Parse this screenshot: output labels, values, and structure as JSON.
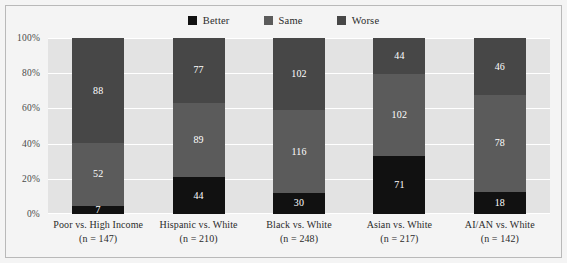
{
  "chart_data": {
    "type": "bar",
    "subtype": "stacked-100-percent",
    "title": "",
    "xlabel": "",
    "ylabel": "",
    "ylim": [
      0,
      100
    ],
    "yticks": [
      "0%",
      "20%",
      "40%",
      "60%",
      "80%",
      "100%"
    ],
    "grid": true,
    "legend_position": "top-center",
    "categories": [
      "Poor vs. High Income",
      "Hispanic vs. White",
      "Black vs. White",
      "Asian vs. White",
      "AI/AN vs. White"
    ],
    "category_n": [
      "(n = 147)",
      "(n = 210)",
      "(n = 248)",
      "(n = 217)",
      "(n = 142)"
    ],
    "series": [
      {
        "name": "Better",
        "color": "#111111",
        "values": [
          7,
          44,
          30,
          71,
          18
        ]
      },
      {
        "name": "Same",
        "color": "#5b5b5b",
        "values": [
          52,
          89,
          116,
          102,
          78
        ]
      },
      {
        "name": "Worse",
        "color": "#474747",
        "values": [
          88,
          77,
          102,
          44,
          46
        ]
      }
    ]
  },
  "legend": {
    "items": [
      {
        "label": "Better",
        "color": "#111111"
      },
      {
        "label": "Same",
        "color": "#5b5b5b"
      },
      {
        "label": "Worse",
        "color": "#474747"
      }
    ]
  },
  "colors": {
    "plot_background": "#e3e3e3",
    "page_background": "#f4f4f4",
    "gridline": "#ffffff",
    "frame_border": "#b9b9b9",
    "axis_text": "#4a4a4a",
    "label_text": "#2b2b2b",
    "value_text": "#ffffff"
  }
}
